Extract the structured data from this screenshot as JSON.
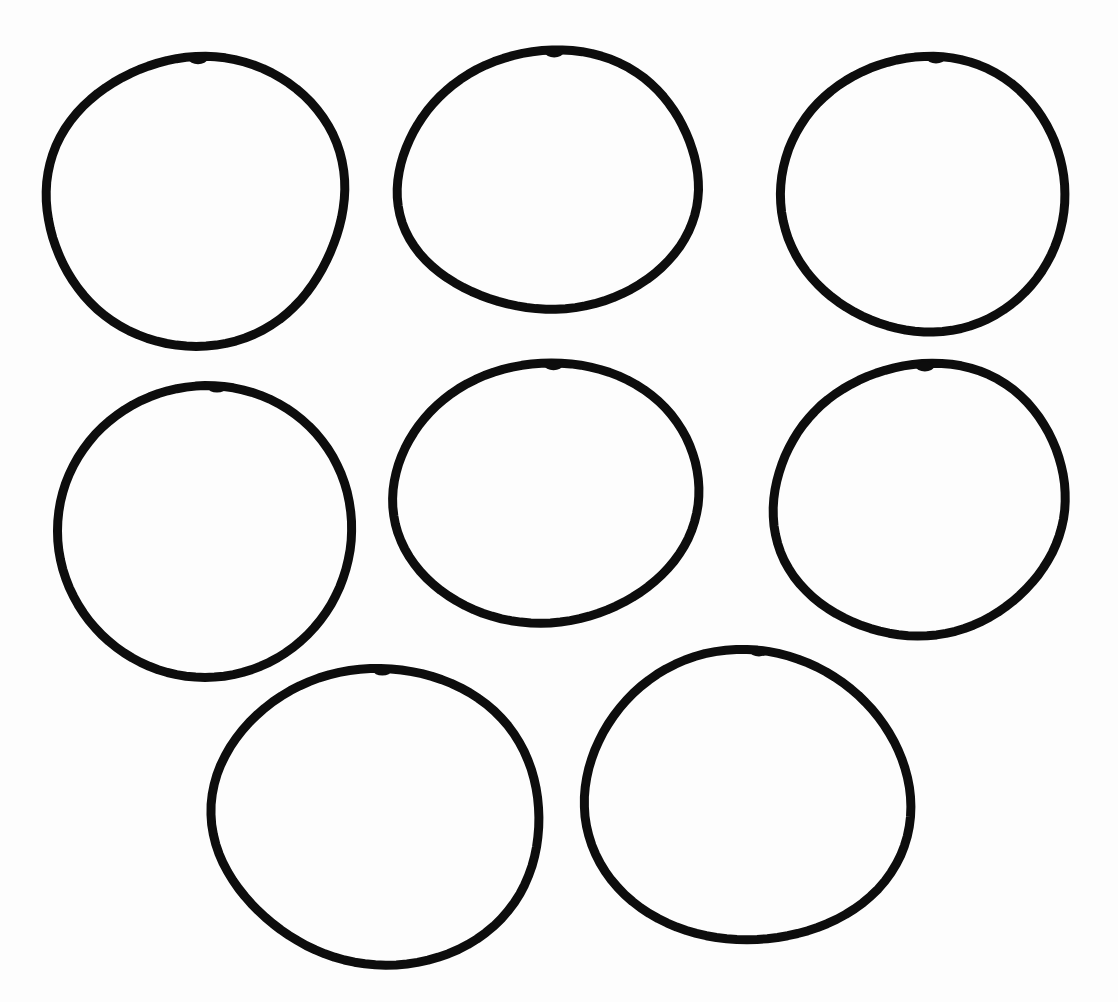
{
  "page": {
    "background": "#fdfdfd",
    "stroke_color": "#0d0d0d"
  },
  "circles": [
    {
      "id": "circle-1",
      "row": 1,
      "col": 1,
      "cx": 196,
      "cy": 200,
      "rx": 150,
      "ry": 144,
      "rot": -4
    },
    {
      "id": "circle-2",
      "row": 1,
      "col": 2,
      "cx": 549,
      "cy": 181,
      "rx": 151,
      "ry": 129,
      "rot": -3
    },
    {
      "id": "circle-3",
      "row": 1,
      "col": 3,
      "cx": 924,
      "cy": 194,
      "rx": 142,
      "ry": 138,
      "rot": 0
    },
    {
      "id": "circle-4",
      "row": 2,
      "col": 1,
      "cx": 205,
      "cy": 531,
      "rx": 146,
      "ry": 147,
      "rot": 0
    },
    {
      "id": "circle-5",
      "row": 2,
      "col": 2,
      "cx": 546,
      "cy": 493,
      "rx": 152,
      "ry": 131,
      "rot": -2
    },
    {
      "id": "circle-6",
      "row": 2,
      "col": 3,
      "cx": 920,
      "cy": 500,
      "rx": 146,
      "ry": 136,
      "rot": -3
    },
    {
      "id": "circle-7",
      "row": 3,
      "col": 1,
      "cx": 378,
      "cy": 816,
      "rx": 162,
      "ry": 150,
      "rot": -3
    },
    {
      "id": "circle-8",
      "row": 3,
      "col": 2,
      "cx": 747,
      "cy": 797,
      "rx": 161,
      "ry": 147,
      "rot": 0
    }
  ]
}
